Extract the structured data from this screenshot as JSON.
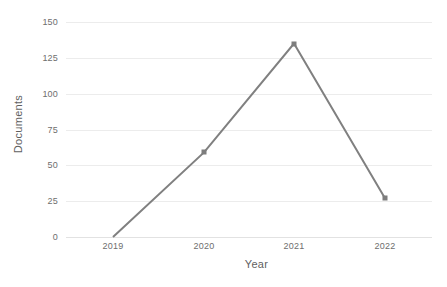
{
  "chart_data": {
    "type": "line",
    "title": "",
    "xlabel": "Year",
    "ylabel": "Documents",
    "categories": [
      "2019",
      "2020",
      "2021",
      "2022"
    ],
    "values": [
      0,
      59,
      135,
      27
    ],
    "series": [
      {
        "name": "Documents",
        "values": [
          0,
          59,
          135,
          27
        ]
      }
    ],
    "x": [
      2019,
      2020,
      2021,
      2022
    ],
    "xlim": [
      2019,
      2022
    ],
    "ylim": [
      0,
      150
    ],
    "yticks": [
      0,
      25,
      50,
      75,
      100,
      125,
      150
    ],
    "ytick_labels": [
      "0",
      "25",
      "50",
      "75",
      "100",
      "125",
      "150"
    ],
    "xticks": [
      2019,
      2020,
      2021,
      2022
    ],
    "xtick_labels": [
      "2019",
      "2020",
      "2021",
      "2022"
    ],
    "grid": "horizontal",
    "legend": "none",
    "marker": "square",
    "line_color": "#808080",
    "marker_color": "#7d7d7d",
    "grid_color": "#ececec",
    "text_color": "#6e6e6e",
    "background": "#ffffff"
  }
}
